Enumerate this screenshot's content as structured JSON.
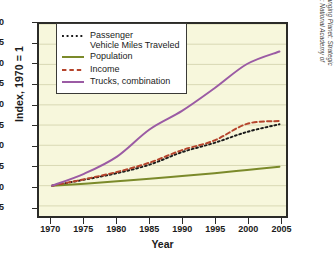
{
  "chart_data": {
    "type": "line",
    "title": "",
    "xlabel": "Year",
    "ylabel": "Index, 1970 = 1",
    "xlim": [
      1968,
      2006
    ],
    "ylim": [
      0.25,
      5.0
    ],
    "xticks": [
      1970,
      1975,
      1980,
      1985,
      1990,
      1995,
      2000,
      2005
    ],
    "yticks": [
      0.5,
      1.0,
      1.5,
      2.0,
      2.5,
      3.0,
      3.5,
      4.0,
      4.5,
      5.0
    ],
    "ytick_labels": [
      "0.5",
      "1.0",
      "1.5",
      "2.0",
      "2.5",
      "3.0",
      "3.5",
      "4.0",
      "4.5",
      "5.0"
    ],
    "xtick_labels": [
      "1970",
      "1975",
      "1980",
      "1985",
      "1990",
      "1995",
      "2000",
      "2005"
    ],
    "grid": "horizontal",
    "legend_position": "top-left",
    "plot_background": "#f7f7dc",
    "x": [
      1970,
      1975,
      1980,
      1985,
      1990,
      1995,
      2000,
      2005
    ],
    "series": [
      {
        "name": "Passenger\nVehicle Miles Traveled",
        "label": "Passenger Vehicle Miles Traveled",
        "color": "#1b1b1b",
        "style": "dotted",
        "values": [
          1.0,
          1.15,
          1.31,
          1.52,
          1.83,
          2.06,
          2.33,
          2.52
        ]
      },
      {
        "name": "Population",
        "label": "Population",
        "color": "#7b8a2a",
        "style": "solid",
        "values": [
          1.0,
          1.05,
          1.11,
          1.17,
          1.24,
          1.31,
          1.39,
          1.47
        ]
      },
      {
        "name": "Income",
        "label": "Income",
        "color": "#b5442c",
        "style": "dashed",
        "values": [
          1.0,
          1.16,
          1.34,
          1.57,
          1.88,
          2.12,
          2.53,
          2.6
        ]
      },
      {
        "name": "Trucks, combination",
        "label": "Trucks, combination",
        "color": "#9b5ba4",
        "style": "solid",
        "values": [
          1.0,
          1.3,
          1.72,
          2.39,
          2.85,
          3.41,
          4.01,
          4.32
        ]
      }
    ]
  },
  "credit": {
    "text": "Courtesy of: Murphy, A. et al. 2010. Understanding the Changing Planet: Strategic Directions for the Geographical Sciences. Washington, DC: National Academy of Sciences of the USA."
  }
}
